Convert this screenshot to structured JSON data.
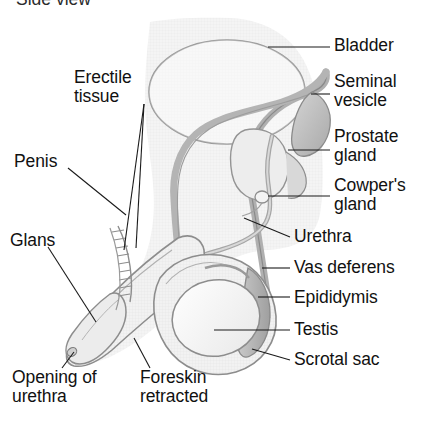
{
  "title": {
    "text": "Side view",
    "note": "clipped at top edge"
  },
  "colors": {
    "ink": "#111111",
    "leader": "#1a1a1a",
    "outline": "#8d8d8d",
    "fill_light": "#f0f0f0",
    "fill_mid": "#dcdcdc",
    "fill_dark": "#b8b8b8",
    "background": "#ffffff"
  },
  "labels": {
    "bladder": "Bladder",
    "seminal_vesicle_line1": "Seminal",
    "seminal_vesicle_line2": "vesicle",
    "prostate_line1": "Prostate",
    "prostate_line2": "gland",
    "cowpers_line1": "Cowper's",
    "cowpers_line2": "gland",
    "urethra": "Urethra",
    "vas_deferens": "Vas deferens",
    "epididymis": "Epididymis",
    "testis": "Testis",
    "scrotal_sac": "Scrotal sac",
    "erectile_line1": "Erectile",
    "erectile_line2": "tissue",
    "penis": "Penis",
    "glans": "Glans",
    "opening_line1": "Opening of",
    "opening_line2": "urethra",
    "foreskin_line1": "Foreskin",
    "foreskin_line2": "retracted"
  },
  "figure": {
    "type": "anatomical-illustration",
    "parts": [
      "bladder",
      "seminal vesicle",
      "prostate gland",
      "Cowper's gland",
      "urethra",
      "vas deferens",
      "epididymis",
      "testis",
      "scrotal sac",
      "erectile tissue",
      "penis",
      "glans",
      "opening of urethra",
      "foreskin retracted"
    ]
  }
}
